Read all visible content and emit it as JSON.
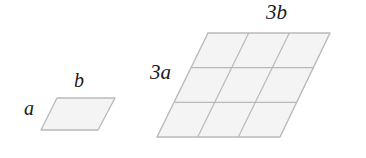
{
  "figure": {
    "title": "",
    "background_color": "#ffffff",
    "shape_fill": "#f4f4f4",
    "shape_stroke": "#b9b9b9",
    "label_color": "#1a1a1a",
    "labels": {
      "small_side_a": "a",
      "small_side_b": "b",
      "large_side_a": "3a",
      "large_side_b": "3b"
    },
    "shapes": [
      {
        "name": "small-parallelogram",
        "rows": 1,
        "columns": 1,
        "vertices": [
          [
            57,
            98
          ],
          [
            115,
            98
          ],
          [
            98,
            130
          ],
          [
            41,
            130
          ]
        ],
        "side_labels": [
          "a",
          "b"
        ]
      },
      {
        "name": "large-parallelogram",
        "rows": 3,
        "columns": 3,
        "vertices": [
          [
            208,
            33
          ],
          [
            330,
            33
          ],
          [
            280,
            137
          ],
          [
            157,
            137
          ]
        ],
        "side_labels": [
          "3a",
          "3b"
        ]
      }
    ]
  }
}
